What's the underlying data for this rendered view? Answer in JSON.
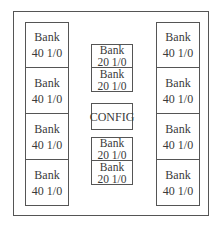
{
  "diagram": {
    "left_column": [
      {
        "line1": "Bank",
        "line2": "40 1/0"
      },
      {
        "line1": "Bank",
        "line2": "40 1/0"
      },
      {
        "line1": "Bank",
        "line2": "40 1/0"
      },
      {
        "line1": "Bank",
        "line2": "40 1/0"
      }
    ],
    "right_column": [
      {
        "line1": "Bank",
        "line2": "40 1/0"
      },
      {
        "line1": "Bank",
        "line2": "40 1/0"
      },
      {
        "line1": "Bank",
        "line2": "40 1/0"
      },
      {
        "line1": "Bank",
        "line2": "40 1/0"
      }
    ],
    "center_top": [
      {
        "line1": "Bank",
        "line2": "20 1/0"
      },
      {
        "line1": "Bank",
        "line2": "20 1/0"
      }
    ],
    "center_config": "CONFIG",
    "center_bottom": [
      {
        "line1": "Bank",
        "line2": "20 1/0"
      },
      {
        "line1": "Bank",
        "line2": "20 1/0"
      }
    ]
  }
}
